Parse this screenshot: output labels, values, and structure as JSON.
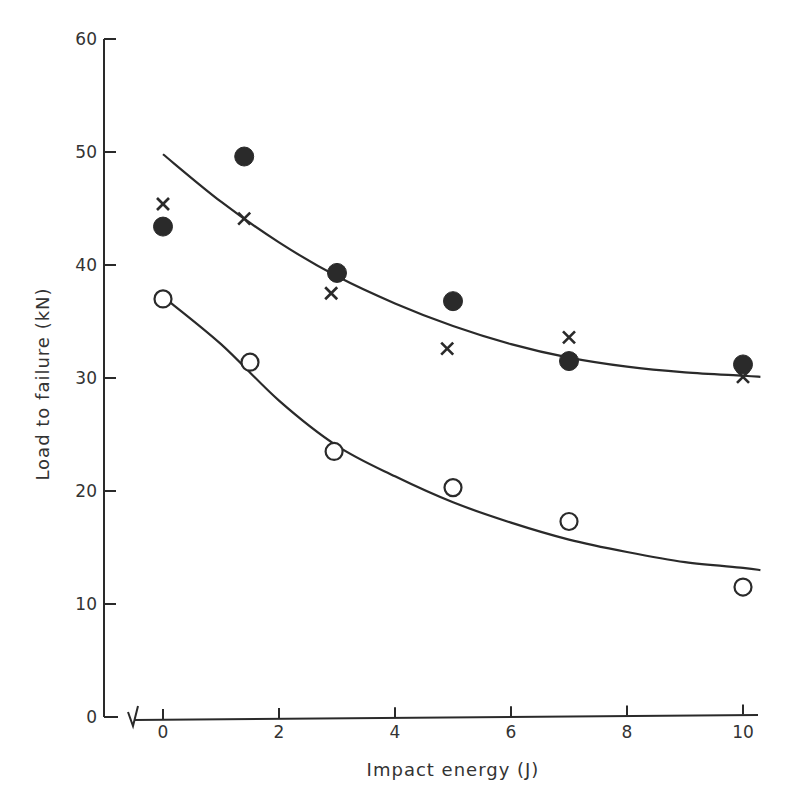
{
  "chart_data": {
    "type": "scatter",
    "title": "",
    "xlabel": "Impact energy (J)",
    "ylabel": "Load to failure (kN)",
    "xlim": [
      0,
      10.3
    ],
    "ylim": [
      0,
      60
    ],
    "x_ticks": [
      0,
      2,
      4,
      6,
      8,
      10
    ],
    "y_ticks": [
      0,
      10,
      20,
      30,
      40,
      50,
      60
    ],
    "x_tick_labels": [
      "0",
      "2",
      "4",
      "6",
      "8",
      "10"
    ],
    "y_tick_labels": [
      "0",
      "10",
      "20",
      "30",
      "40",
      "50",
      "60"
    ],
    "axis_break": true,
    "grid": false,
    "legend": null,
    "series": [
      {
        "name": "filled circles",
        "marker": "filled-circle",
        "x": [
          0,
          1.4,
          3.0,
          5.0,
          7.0,
          10.0
        ],
        "y": [
          43.4,
          49.6,
          39.3,
          36.8,
          31.5,
          31.2
        ]
      },
      {
        "name": "crosses",
        "marker": "cross",
        "x": [
          0,
          1.4,
          2.9,
          4.9,
          7.0,
          10.0
        ],
        "y": [
          45.4,
          44.1,
          37.5,
          32.6,
          33.6,
          30.1
        ]
      },
      {
        "name": "open circles",
        "marker": "open-circle",
        "x": [
          0,
          1.5,
          2.95,
          5.0,
          7.0,
          10.0
        ],
        "y": [
          37.0,
          31.4,
          23.5,
          20.3,
          17.3,
          11.5
        ]
      }
    ],
    "fit_curves": [
      {
        "name": "upper fit (filled circles & crosses)",
        "x": [
          0,
          1,
          2,
          3,
          4,
          5,
          6,
          7,
          8,
          9,
          10,
          10.3
        ],
        "y": [
          49.8,
          45.6,
          42.0,
          39.0,
          36.6,
          34.6,
          33.0,
          31.8,
          31.0,
          30.5,
          30.2,
          30.1
        ]
      },
      {
        "name": "lower fit (open circles)",
        "x": [
          0,
          1,
          2,
          3,
          4,
          5,
          6,
          7,
          8,
          9,
          10,
          10.3
        ],
        "y": [
          37.2,
          33.0,
          28.0,
          24.0,
          21.3,
          19.0,
          17.2,
          15.7,
          14.6,
          13.7,
          13.2,
          13.0
        ]
      }
    ]
  },
  "labels": {
    "x_axis_title": "Impact energy (J)",
    "y_axis_title": "Load to failure (kN)"
  }
}
